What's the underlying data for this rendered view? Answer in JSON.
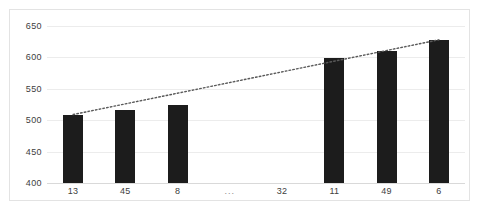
{
  "chart_data": {
    "type": "bar",
    "title": "",
    "xlabel": "",
    "ylabel": "",
    "categories": [
      "13",
      "45",
      "8",
      "...",
      "32",
      "11",
      "49",
      "6"
    ],
    "values": [
      509,
      516,
      525,
      null,
      null,
      599,
      611,
      628
    ],
    "ylim": [
      400,
      650
    ],
    "yticks": [
      400,
      450,
      500,
      550,
      600,
      650
    ],
    "ytick_labels": [
      "400",
      "450",
      "500",
      "550",
      "600",
      "650"
    ],
    "grid": "horizontal",
    "legend": "none",
    "series": [
      {
        "name": "bars",
        "type": "bar",
        "values": [
          509,
          516,
          525,
          null,
          null,
          599,
          611,
          628
        ],
        "color": "#1c1c1c"
      },
      {
        "name": "trendline",
        "type": "line",
        "style": "dotted",
        "color": "#595959",
        "from": {
          "category": "13",
          "value": 509
        },
        "to": {
          "category": "6",
          "value": 628
        }
      }
    ],
    "annotations": [
      {
        "text": "...",
        "category_index": 3,
        "note": "axis break placeholder, no bar"
      }
    ],
    "colors": {
      "bar": "#1c1c1c",
      "trendline": "#595959",
      "gridline": "#ececec",
      "border": "#e3e3e3",
      "background": "#ffffff",
      "tick_text": "#404040"
    }
  }
}
